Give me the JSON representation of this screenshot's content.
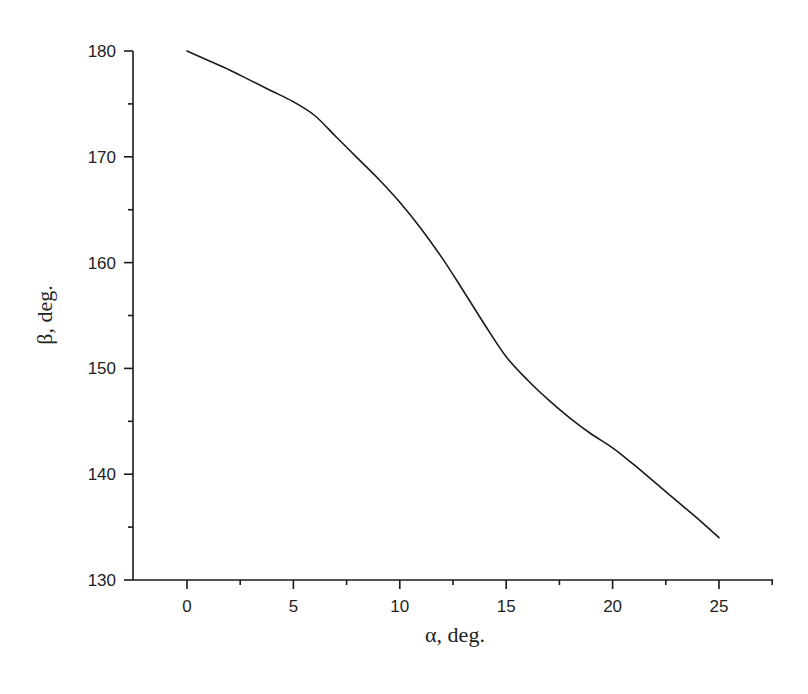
{
  "chart_data": {
    "type": "line",
    "title": "",
    "xlabel": "α, deg.",
    "ylabel": "β, deg.",
    "xlim": [
      -2.5,
      27.5
    ],
    "ylim": [
      130,
      180
    ],
    "x_ticks": [
      0,
      5,
      10,
      15,
      20,
      25
    ],
    "x_minor_ticks": [
      -2.5,
      2.5,
      7.5,
      12.5,
      17.5,
      22.5,
      27.5
    ],
    "y_ticks": [
      130,
      140,
      150,
      160,
      170,
      180
    ],
    "y_minor_ticks": [
      135,
      145,
      155,
      165,
      175
    ],
    "grid": false,
    "legend": null,
    "series": [
      {
        "name": "β(α)",
        "color": "#1a1a1a",
        "x": [
          0,
          1,
          2,
          3,
          4,
          5,
          6,
          7,
          8,
          9,
          10,
          11,
          12,
          13,
          14,
          15,
          16,
          17,
          18,
          19,
          20,
          21,
          22,
          23,
          24,
          25
        ],
        "values": [
          180,
          179.1,
          178.2,
          177.2,
          176.2,
          175.2,
          173.9,
          171.9,
          169.9,
          167.9,
          165.7,
          163.2,
          160.4,
          157.3,
          154.1,
          151.1,
          148.9,
          147.0,
          145.3,
          143.8,
          142.5,
          140.9,
          139.2,
          137.5,
          135.8,
          134.0
        ]
      }
    ]
  },
  "labels": {
    "x_title": "α, deg.",
    "y_title": "β, deg.",
    "x_ticks": [
      "0",
      "5",
      "10",
      "15",
      "20",
      "25"
    ],
    "y_ticks": [
      "130",
      "140",
      "150",
      "160",
      "170",
      "180"
    ]
  }
}
